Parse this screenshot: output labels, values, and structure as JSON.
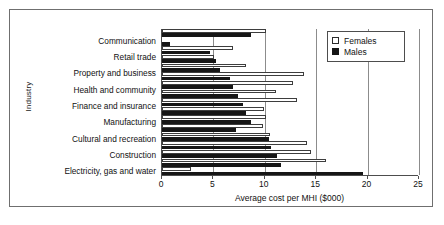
{
  "chart_data": {
    "type": "bar",
    "orientation": "horizontal",
    "title": "",
    "xlabel": "Average cost per MHI ($000)",
    "ylabel": "Industry",
    "xlim": [
      0,
      25
    ],
    "xticks": [
      0,
      5,
      10,
      15,
      20,
      25
    ],
    "grid": true,
    "legend_position": "top-right",
    "categories": [
      "Communication",
      "Retail trade",
      "Property and business",
      "Health and community",
      "Finance and insurance",
      "Manufacturing",
      "Cultural and recreation",
      "Construction",
      "Electricity, gas and water"
    ],
    "series": [
      {
        "name": "Females",
        "color": "#ffffff",
        "values": [
          10.1,
          6.9,
          8.2,
          13.8,
          11.1,
          9.9,
          10.1,
          9.8,
          14.2
        ]
      },
      {
        "name": "Males",
        "color": "#161616",
        "values": [
          8.7,
          0.8,
          4.7,
          5.4,
          6.6,
          6.8,
          7.3,
          8.0,
          8.2
        ]
      }
    ],
    "series_rows": [
      {
        "females": 10.1,
        "males": 8.7
      },
      {
        "females": 6.9,
        "males": 0.8
      },
      {
        "females": 8.2,
        "males": 4.7
      },
      {
        "females": 13.8,
        "males": 5.4
      },
      {
        "females": 12.7,
        "males": 6.6
      },
      {
        "females": 11.1,
        "males": 6.8
      },
      {
        "females": 13.1,
        "males": 7.3
      },
      {
        "females": 9.9,
        "males": 8.0
      },
      {
        "females": 10.1,
        "males": 8.2
      },
      {
        "females": 9.8,
        "males": 8.6
      },
      {
        "females": 14.1,
        "males": 10.4
      },
      {
        "females": 14.5,
        "males": 10.6
      },
      {
        "females": 16.0,
        "males": 11.2
      },
      {
        "females": 2.8,
        "males": 11.6
      },
      {
        "females": 0,
        "males": 19.6
      }
    ]
  },
  "bars": [
    {
      "row": 0,
      "series": "Females",
      "value": 10.1
    },
    {
      "row": 1,
      "series": "Males",
      "value": 8.7
    },
    {
      "row": 2,
      "series": "Females",
      "value": 0.0
    },
    {
      "row": 3,
      "series": "Males",
      "value": 0.8
    },
    {
      "row": 4,
      "series": "Females",
      "value": 6.9
    },
    {
      "row": 5,
      "series": "Males",
      "value": 4.7
    },
    {
      "row": 6,
      "series": "Females",
      "value": 5.1
    },
    {
      "row": 7,
      "series": "Males",
      "value": 5.3
    },
    {
      "row": 8,
      "series": "Females",
      "value": 8.2
    },
    {
      "row": 9,
      "series": "Males",
      "value": 5.6
    },
    {
      "row": 10,
      "series": "Females",
      "value": 13.8
    },
    {
      "row": 11,
      "series": "Males",
      "value": 6.6
    },
    {
      "row": 12,
      "series": "Females",
      "value": 12.7
    },
    {
      "row": 13,
      "series": "Males",
      "value": 6.9
    },
    {
      "row": 14,
      "series": "Females",
      "value": 11.1
    },
    {
      "row": 15,
      "series": "Males",
      "value": 7.4
    },
    {
      "row": 16,
      "series": "Females",
      "value": 13.1
    },
    {
      "row": 17,
      "series": "Males",
      "value": 7.9
    },
    {
      "row": 18,
      "series": "Females",
      "value": 9.9
    },
    {
      "row": 19,
      "series": "Males",
      "value": 8.2
    },
    {
      "row": 20,
      "series": "Females",
      "value": 10.1
    },
    {
      "row": 21,
      "series": "Males",
      "value": 8.7
    },
    {
      "row": 22,
      "series": "Females",
      "value": 9.8
    },
    {
      "row": 23,
      "series": "Males",
      "value": 7.2
    },
    {
      "row": 24,
      "series": "Females",
      "value": 10.5
    },
    {
      "row": 25,
      "series": "Males",
      "value": 10.4
    },
    {
      "row": 26,
      "series": "Females",
      "value": 14.1
    },
    {
      "row": 27,
      "series": "Males",
      "value": 10.6
    },
    {
      "row": 28,
      "series": "Females",
      "value": 14.5
    },
    {
      "row": 29,
      "series": "Males",
      "value": 11.2
    },
    {
      "row": 30,
      "series": "Females",
      "value": 16.0
    },
    {
      "row": 31,
      "series": "Males",
      "value": 11.6
    },
    {
      "row": 32,
      "series": "Females",
      "value": 2.8
    },
    {
      "row": 33,
      "series": "Males",
      "value": 19.6
    }
  ],
  "axis": {
    "y_title": "Industry",
    "x_title": "Average cost per MHI ($000)",
    "x_tick_labels": [
      "0",
      "5",
      "10",
      "15",
      "20",
      "25"
    ]
  },
  "category_labels": [
    "Communication",
    "Retail trade",
    "Property and business",
    "Health and community",
    "Finance and insurance",
    "Manufacturing",
    "Cultural and recreation",
    "Construction",
    "Electricity, gas and water"
  ],
  "legend": {
    "items": [
      {
        "label": "Females",
        "swatch": "open-square",
        "color": "#ffffff"
      },
      {
        "label": "Males",
        "swatch": "filled-square",
        "color": "#161616"
      }
    ]
  }
}
